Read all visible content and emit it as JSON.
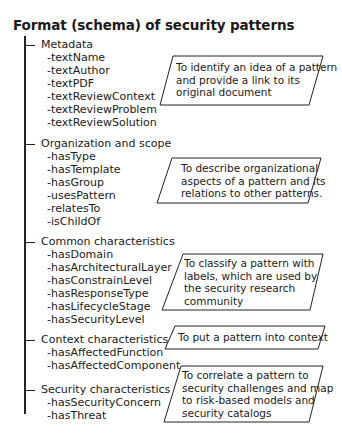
{
  "title": "Format (schema) of security patterns",
  "sections": [
    {
      "label": "Metadata",
      "items": [
        "-textName",
        "-textAuthor",
        "-textPDF",
        "-textReviewContext",
        "-textReviewProblem",
        "-textReviewSolution"
      ],
      "note": [
        "To identify an idea of a pattern",
        "and provide a link to its",
        "original document"
      ]
    },
    {
      "label": "Organization and scope",
      "items": [
        "-hasType",
        "-hasTemplate",
        "-hasGroup",
        "-usesPattern",
        "-relatesTo",
        "-isChildOf"
      ],
      "note": [
        "To describe organizational",
        "aspects of a pattern and its",
        "relations to other patterns."
      ]
    },
    {
      "label": "Common characteristics",
      "items": [
        "-hasDomain",
        "-hasArchitecturalLayer",
        "-hasConstrainLevel",
        "-hasResponseType",
        "-hasLifecycleStage",
        "-hasSecurityLevel"
      ],
      "note": [
        "To classify a pattern with",
        "labels, which are used by",
        "the security research",
        "community"
      ]
    },
    {
      "label": "Context characteristics",
      "items": [
        "-hasAffectedFunction",
        "-hasAffectedComponent"
      ],
      "note": [
        "To put a pattern into context"
      ]
    },
    {
      "label": "Security characteristics",
      "items": [
        "-hasSecurityConcern",
        "-hasThreat"
      ],
      "note": [
        "To correlate a pattern to",
        "security challenges and map",
        "to risk-based models and",
        "security catalogs"
      ]
    }
  ]
}
